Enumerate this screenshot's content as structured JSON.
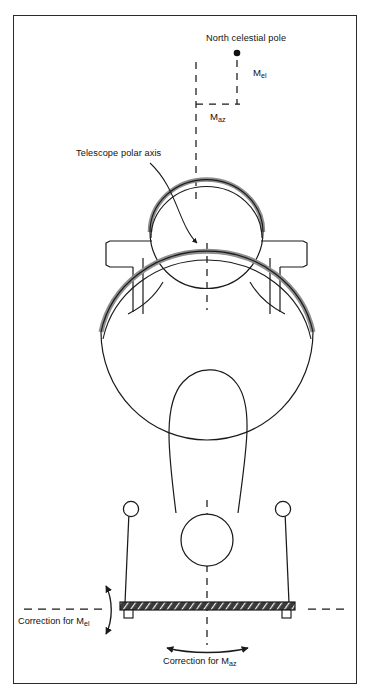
{
  "figure": {
    "kind": "technical-line-diagram",
    "border_color": "#2b2b2b",
    "background_color": "#ffffff",
    "line_color": "#1a1a1a",
    "shade_color": "#9a9a9a"
  },
  "labels": {
    "north_celestial_pole": "North celestial pole",
    "m_el_base": "M",
    "m_el_sub": "el",
    "m_az_base": "M",
    "m_az_sub": "az",
    "telescope_polar_axis": "Telescope polar axis",
    "correction_for_mel_base": "Correction for M",
    "correction_for_mel_sub": "el",
    "correction_for_maz_base": "Correction for M",
    "correction_for_maz_sub": "az"
  },
  "annotations": {
    "pole_marker": "filled-dot",
    "mel_offset_direction": "vertical",
    "maz_offset_direction": "horizontal",
    "polar_axis_leader": "curved-arrow-to-center",
    "mel_correction_arrow": "double-headed-vertical-arc",
    "maz_correction_arrow": "double-headed-horizontal-arc"
  },
  "parts": {
    "secondary_assembly": "upper-circle",
    "primary_dish": "large-ellipse",
    "dish_rim": "shaded-arc",
    "yoke": "teardrop-counterweight",
    "side_brackets": "left-and-right-arms",
    "pedestal": "trapezoid-base",
    "trunnion_bearings": "two-small-circles",
    "azimuth_bearing": "center-circle",
    "base_plate": "hatched-bar",
    "feet": "two-anchor-feet",
    "centerline": "vertical-dashed-axis",
    "horizon_line": "horizontal-dashed-line"
  }
}
